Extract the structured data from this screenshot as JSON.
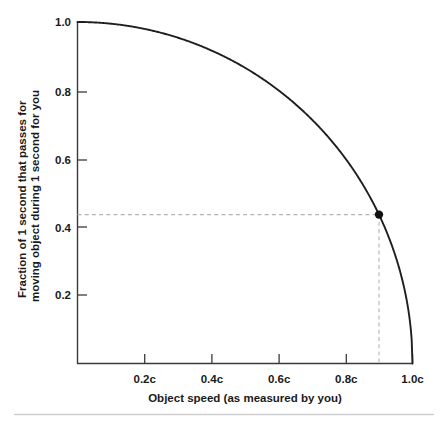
{
  "chart_data": {
    "type": "line",
    "title": "",
    "subtitle": "",
    "xlabel": "Object speed (as measured by you)",
    "ylabel": "Fraction of 1 second that passes for moving object during 1 second for you",
    "ylabel_lines": [
      "Fraction of 1 second that passes for",
      "moving object during 1 second for you"
    ],
    "xlim": [
      0,
      1.0
    ],
    "ylim": [
      0,
      1.0
    ],
    "grid": false,
    "legend": "none",
    "x_tick_values": [
      0.2,
      0.4,
      0.6,
      0.8,
      1.0
    ],
    "x_tick_labels": [
      "0.2c",
      "0.4c",
      "0.6c",
      "0.8c",
      "1.0c"
    ],
    "y_tick_values": [
      0.2,
      0.4,
      0.6,
      0.8,
      1.0
    ],
    "y_tick_labels": [
      "0.2",
      "0.4",
      "0.6",
      "0.8",
      "1.0"
    ],
    "series": [
      {
        "name": "Lorentz factor inverse",
        "formula": "sqrt(1 - v^2)",
        "x": [
          0.0,
          0.05,
          0.1,
          0.15,
          0.2,
          0.25,
          0.3,
          0.35,
          0.4,
          0.45,
          0.5,
          0.55,
          0.6,
          0.65,
          0.7,
          0.75,
          0.8,
          0.85,
          0.9,
          0.92,
          0.94,
          0.96,
          0.98,
          0.99,
          1.0
        ],
        "y": [
          1.0,
          0.999,
          0.995,
          0.989,
          0.98,
          0.968,
          0.954,
          0.937,
          0.917,
          0.893,
          0.866,
          0.835,
          0.8,
          0.76,
          0.714,
          0.661,
          0.6,
          0.527,
          0.436,
          0.392,
          0.341,
          0.28,
          0.199,
          0.141,
          0.0
        ]
      }
    ],
    "annotations": [
      {
        "name": "marked-point",
        "x": 0.9,
        "y": 0.436,
        "x_label": "0.9c",
        "y_label": "0.43",
        "marker": "filled-circle",
        "guide_lines": [
          "horizontal-dashed-to-y-axis",
          "vertical-dashed-to-x-axis"
        ]
      }
    ]
  },
  "axis": {
    "x_title": "Object speed (as measured by you)",
    "y_title_line1": "Fraction of 1 second that passes for",
    "y_title_line2": "moving object during 1 second for you",
    "x_ticks": [
      "0.2c",
      "0.4c",
      "0.6c",
      "0.8c",
      "1.0c"
    ],
    "y_ticks": [
      "1.0",
      "0.8",
      "0.6",
      "0.4",
      "0.2"
    ]
  },
  "colors": {
    "curve": "#1f1f1f",
    "axis": "#3a3a3a",
    "guide": "#b4b4b4",
    "marker": "#111111",
    "text": "#1a1a1a",
    "footer_rule": "#cfcfcf",
    "background": "#ffffff"
  }
}
